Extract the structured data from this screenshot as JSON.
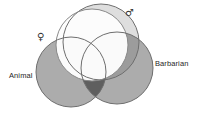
{
  "figure": {
    "type": "venn-diagram",
    "background_color": "#ffffff",
    "width": 199,
    "height": 119,
    "stroke_color": "#6b6b6b",
    "labels": {
      "animal": "Animal",
      "barbarian": "Barbarian",
      "female_symbol": "♀",
      "male_symbol": "♂"
    },
    "sets": [
      {
        "id": "male",
        "label": "♂",
        "kind": "symbol",
        "cx": 101,
        "cy": 42,
        "r": 38,
        "fill": "#c9c9c9",
        "opacity": 0.55,
        "stroke": "#6b6b6b"
      },
      {
        "id": "female",
        "label": "♀",
        "kind": "symbol",
        "cx": 92,
        "cy": 45,
        "r": 36,
        "fill": "#ffffff",
        "opacity": 0.95,
        "stroke": "#7a7a7a"
      },
      {
        "id": "animal",
        "label": "Animal",
        "kind": "text",
        "cx": 71,
        "cy": 72,
        "r": 35,
        "fill": "#9e9e9e",
        "opacity": 0.8,
        "stroke": "#6b6b6b"
      },
      {
        "id": "barbarian",
        "label": "Barbarian",
        "kind": "text",
        "cx": 117,
        "cy": 68,
        "r": 36,
        "fill": "#9e9e9e",
        "opacity": 0.8,
        "stroke": "#6b6b6b"
      }
    ],
    "intersection_shading": {
      "animal_female_crescent": "#3a3a3a",
      "triple_core": "#101010"
    }
  }
}
